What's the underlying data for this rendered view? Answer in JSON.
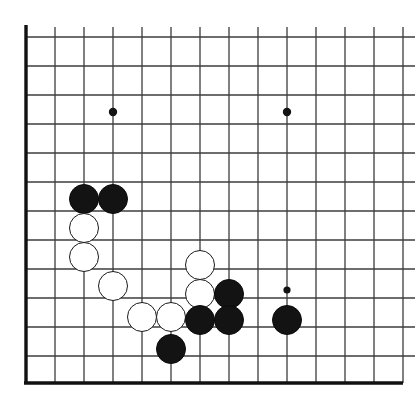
{
  "diagram": {
    "kind": "go-board-diagram",
    "width": 415,
    "height": 409,
    "background_color": "#ffffff",
    "line_color": "#3c3c3c",
    "border_color": "#111111",
    "black_stone_color": "#131313",
    "white_stone_color": "#ffffff",
    "white_stone_border_color": "#1a1a1a",
    "line_width": 1.3,
    "border_width": 3.4,
    "stone_radius": 15.2
  },
  "grid": {
    "origin_x": 26,
    "origin_y": 37,
    "spacing": 29,
    "vertical_lines_x": [
      26,
      55,
      84,
      113,
      142,
      171,
      200,
      229,
      258,
      287,
      316,
      345,
      374,
      403
    ],
    "horizontal_lines_y": [
      37,
      66,
      95,
      112,
      124,
      153,
      182,
      199,
      211,
      240,
      269,
      286,
      298,
      327,
      356,
      383
    ],
    "edges": {
      "left_border_x": 26,
      "bottom_border_y": 383,
      "top_open": true,
      "right_open": true
    }
  },
  "star_points": [
    {
      "name": "star-point-upper-left",
      "x": 113,
      "y": 112,
      "radius": 4.2
    },
    {
      "name": "star-point-upper-right",
      "x": 287,
      "y": 112,
      "radius": 4.2
    },
    {
      "name": "star-point-lower-right",
      "x": 287,
      "y": 290,
      "radius": 3.6
    }
  ],
  "stones": [
    {
      "color": "black",
      "x": 84,
      "y": 199,
      "label": "black-stone-1"
    },
    {
      "color": "black",
      "x": 113,
      "y": 199,
      "label": "black-stone-2"
    },
    {
      "color": "white",
      "x": 84,
      "y": 228,
      "label": "white-stone-1"
    },
    {
      "color": "white",
      "x": 84,
      "y": 257,
      "label": "white-stone-2"
    },
    {
      "color": "white",
      "x": 113,
      "y": 286,
      "label": "white-stone-3"
    },
    {
      "color": "white",
      "x": 200,
      "y": 265,
      "label": "white-stone-4"
    },
    {
      "color": "white",
      "x": 200,
      "y": 294,
      "label": "white-stone-5"
    },
    {
      "color": "white",
      "x": 142,
      "y": 317,
      "label": "white-stone-6"
    },
    {
      "color": "white",
      "x": 171,
      "y": 317,
      "label": "white-stone-7"
    },
    {
      "color": "black",
      "x": 229,
      "y": 294,
      "label": "black-stone-3"
    },
    {
      "color": "black",
      "x": 200,
      "y": 320,
      "label": "black-stone-4"
    },
    {
      "color": "black",
      "x": 229,
      "y": 320,
      "label": "black-stone-5"
    },
    {
      "color": "black",
      "x": 287,
      "y": 320,
      "label": "black-stone-6"
    },
    {
      "color": "black",
      "x": 171,
      "y": 349,
      "label": "black-stone-7"
    }
  ],
  "counts": {
    "black_stones": 7,
    "white_stones": 7,
    "total_stones": 14,
    "star_points": 3
  }
}
